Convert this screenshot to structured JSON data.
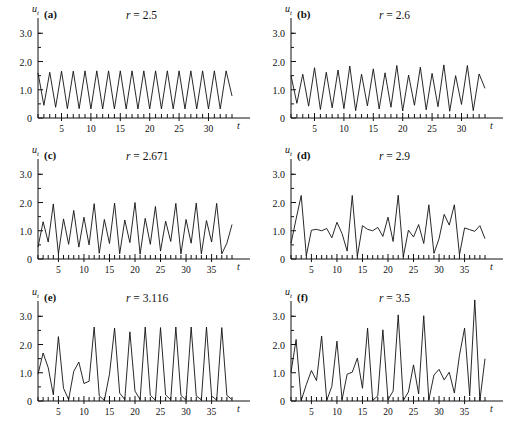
{
  "figure": {
    "axis_labels": {
      "y": "u",
      "y_sub": "t",
      "x": "t"
    },
    "y_ticks": [
      "0",
      "1.0",
      "2.0",
      "3.0"
    ],
    "y_tick_values": [
      0,
      1.0,
      2.0,
      3.0
    ],
    "ylim": [
      0,
      3.4
    ],
    "minor_tick_step": 0.5,
    "x_minor_tick_step": 1,
    "line_color": "#111111",
    "background_color": "#ffffff"
  },
  "chart_data": [
    {
      "type": "line",
      "panel": "(a)",
      "title": "r = 2.5",
      "r_symbol": "r",
      "r_eq": "=",
      "r_value": "2.5",
      "xlabel": "t",
      "ylabel": "u_t",
      "xlim": [
        1,
        34
      ],
      "ylim": [
        0,
        3.4
      ],
      "x_ticks": [
        5,
        10,
        15,
        20,
        25,
        30
      ],
      "x_tick_labels": [
        "5",
        "10",
        "15",
        "20",
        "25",
        "30"
      ],
      "y_ticks": [
        0,
        1.0,
        2.0,
        3.0
      ],
      "grid": false,
      "x": [
        1,
        2,
        3,
        4,
        5,
        6,
        7,
        8,
        9,
        10,
        11,
        12,
        13,
        14,
        15,
        16,
        17,
        18,
        19,
        20,
        21,
        22,
        23,
        24,
        25,
        26,
        27,
        28,
        29,
        30,
        31,
        32,
        33,
        34
      ],
      "values": [
        1.6,
        0.45,
        1.62,
        0.38,
        1.66,
        0.33,
        1.66,
        0.33,
        1.67,
        0.32,
        1.67,
        0.32,
        1.67,
        0.32,
        1.67,
        0.32,
        1.67,
        0.32,
        1.67,
        0.32,
        1.67,
        0.32,
        1.67,
        0.32,
        1.67,
        0.32,
        1.67,
        0.32,
        1.67,
        0.32,
        1.67,
        0.32,
        1.67,
        0.78
      ]
    },
    {
      "type": "line",
      "panel": "(b)",
      "title": "r = 2.6",
      "r_symbol": "r",
      "r_eq": "=",
      "r_value": "2.6",
      "xlabel": "t",
      "ylabel": "u_t",
      "xlim": [
        1,
        34
      ],
      "ylim": [
        0,
        3.4
      ],
      "x_ticks": [
        5,
        10,
        15,
        20,
        25,
        30
      ],
      "x_tick_labels": [
        "5",
        "10",
        "15",
        "20",
        "25",
        "30"
      ],
      "y_ticks": [
        0,
        1.0,
        2.0,
        3.0
      ],
      "grid": false,
      "x": [
        1,
        2,
        3,
        4,
        5,
        6,
        7,
        8,
        9,
        10,
        11,
        12,
        13,
        14,
        15,
        16,
        17,
        18,
        19,
        20,
        21,
        22,
        23,
        24,
        25,
        26,
        27,
        28,
        29,
        30,
        31,
        32,
        33,
        34
      ],
      "values": [
        1.5,
        0.52,
        1.55,
        0.42,
        1.78,
        0.3,
        1.62,
        0.36,
        1.7,
        0.33,
        1.84,
        0.26,
        1.55,
        0.43,
        1.74,
        0.32,
        1.6,
        0.38,
        1.86,
        0.25,
        1.52,
        0.45,
        1.8,
        0.29,
        1.58,
        0.4,
        1.88,
        0.24,
        1.5,
        0.48,
        1.86,
        0.26,
        1.56,
        1.05
      ]
    },
    {
      "type": "line",
      "panel": "(c)",
      "title": "r = 2.671",
      "r_symbol": "r",
      "r_eq": "=",
      "r_value": "2.671",
      "xlabel": "t",
      "ylabel": "u_t",
      "xlim": [
        1,
        39
      ],
      "ylim": [
        0,
        3.4
      ],
      "x_ticks": [
        5,
        10,
        15,
        20,
        25,
        30,
        35
      ],
      "x_tick_labels": [
        "5",
        "10",
        "15",
        "20",
        "25",
        "30",
        "35"
      ],
      "y_ticks": [
        0,
        1.0,
        2.0,
        3.0
      ],
      "grid": false,
      "x": [
        1,
        2,
        3,
        4,
        5,
        6,
        7,
        8,
        9,
        10,
        11,
        12,
        13,
        14,
        15,
        16,
        17,
        18,
        19,
        20,
        21,
        22,
        23,
        24,
        25,
        26,
        27,
        28,
        29,
        30,
        31,
        32,
        33,
        34,
        35,
        36,
        37,
        38,
        39
      ],
      "values": [
        0.42,
        1.32,
        0.6,
        1.95,
        0.18,
        1.42,
        0.52,
        1.72,
        0.42,
        1.48,
        0.5,
        1.96,
        0.2,
        1.4,
        0.55,
        1.98,
        0.18,
        1.38,
        0.58,
        2.0,
        0.17,
        1.44,
        0.52,
        1.86,
        0.28,
        1.34,
        0.62,
        1.97,
        0.18,
        1.4,
        0.56,
        1.98,
        0.18,
        1.36,
        0.6,
        1.97,
        0.18,
        0.56,
        1.22
      ]
    },
    {
      "type": "line",
      "panel": "(d)",
      "title": "r = 2.9",
      "r_symbol": "r",
      "r_eq": "=",
      "r_value": "2.9",
      "xlabel": "t",
      "ylabel": "u_t",
      "xlim": [
        1,
        39
      ],
      "ylim": [
        0,
        3.4
      ],
      "x_ticks": [
        5,
        10,
        15,
        20,
        25,
        30,
        35
      ],
      "x_tick_labels": [
        "5",
        "10",
        "15",
        "20",
        "25",
        "30",
        "35"
      ],
      "y_ticks": [
        0,
        1.0,
        2.0,
        3.0
      ],
      "grid": false,
      "x": [
        1,
        2,
        3,
        4,
        5,
        6,
        7,
        8,
        9,
        10,
        11,
        12,
        13,
        14,
        15,
        16,
        17,
        18,
        19,
        20,
        21,
        22,
        23,
        24,
        25,
        26,
        27,
        28,
        29,
        30,
        31,
        32,
        33,
        34,
        35,
        36,
        37,
        38,
        39
      ],
      "values": [
        0.55,
        1.42,
        2.25,
        0.12,
        1.02,
        1.05,
        1.0,
        1.08,
        0.75,
        1.3,
        0.9,
        0.28,
        2.25,
        0.1,
        1.18,
        1.05,
        1.0,
        1.12,
        0.8,
        1.48,
        0.62,
        2.26,
        0.08,
        1.02,
        0.78,
        1.22,
        0.55,
        1.92,
        0.2,
        0.72,
        1.58,
        1.2,
        1.92,
        0.15,
        1.1,
        1.04,
        0.98,
        1.18,
        0.72
      ]
    },
    {
      "type": "line",
      "panel": "(e)",
      "title": "r = 3.116",
      "r_symbol": "r",
      "r_eq": "=",
      "r_value": "3.116",
      "xlabel": "t",
      "ylabel": "u_t",
      "xlim": [
        1,
        39
      ],
      "ylim": [
        0,
        3.4
      ],
      "x_ticks": [
        5,
        10,
        15,
        20,
        25,
        30,
        35
      ],
      "x_tick_labels": [
        "5",
        "10",
        "15",
        "20",
        "25",
        "30",
        "35"
      ],
      "y_ticks": [
        0,
        1.0,
        2.0,
        3.0
      ],
      "grid": false,
      "x": [
        1,
        2,
        3,
        4,
        5,
        6,
        7,
        8,
        9,
        10,
        11,
        12,
        13,
        14,
        15,
        16,
        17,
        18,
        19,
        20,
        21,
        22,
        23,
        24,
        25,
        26,
        27,
        28,
        29,
        30,
        31,
        32,
        33,
        34,
        35,
        36,
        37,
        38,
        39
      ],
      "values": [
        0.95,
        1.7,
        1.18,
        0.22,
        2.28,
        0.45,
        0.05,
        1.05,
        1.38,
        0.62,
        0.7,
        2.62,
        0.18,
        0.02,
        0.95,
        2.58,
        0.28,
        0.05,
        2.45,
        0.35,
        0.05,
        2.62,
        0.2,
        0.03,
        2.6,
        0.22,
        0.04,
        2.62,
        0.2,
        0.03,
        2.62,
        0.18,
        0.04,
        2.62,
        0.18,
        0.03,
        2.6,
        0.2,
        0.05
      ]
    },
    {
      "type": "line",
      "panel": "(f)",
      "title": "r = 3.5",
      "r_symbol": "r",
      "r_eq": "=",
      "r_value": "3.5",
      "xlabel": "t",
      "ylabel": "u_t",
      "xlim": [
        1,
        39
      ],
      "ylim": [
        0,
        3.8
      ],
      "x_ticks": [
        5,
        10,
        15,
        20,
        25,
        30,
        35
      ],
      "x_tick_labels": [
        "5",
        "10",
        "15",
        "20",
        "25",
        "30",
        "35"
      ],
      "y_ticks": [
        0,
        1.0,
        2.0,
        3.0
      ],
      "grid": false,
      "x": [
        1,
        2,
        3,
        4,
        5,
        6,
        7,
        8,
        9,
        10,
        11,
        12,
        13,
        14,
        15,
        16,
        17,
        18,
        19,
        20,
        21,
        22,
        23,
        24,
        25,
        26,
        27,
        28,
        29,
        30,
        31,
        32,
        33,
        34,
        35,
        36,
        37,
        38,
        39
      ],
      "values": [
        1.02,
        2.18,
        0.02,
        0.58,
        1.08,
        0.72,
        2.3,
        0.02,
        0.52,
        2.12,
        0.05,
        0.95,
        1.02,
        1.52,
        0.45,
        2.58,
        0.02,
        0.18,
        2.52,
        0.04,
        0.35,
        3.05,
        0.02,
        0.32,
        1.28,
        0.25,
        3.02,
        0.04,
        0.92,
        1.12,
        0.75,
        1.02,
        0.28,
        1.62,
        2.58,
        0.18,
        3.58,
        0.02,
        1.5
      ]
    }
  ]
}
